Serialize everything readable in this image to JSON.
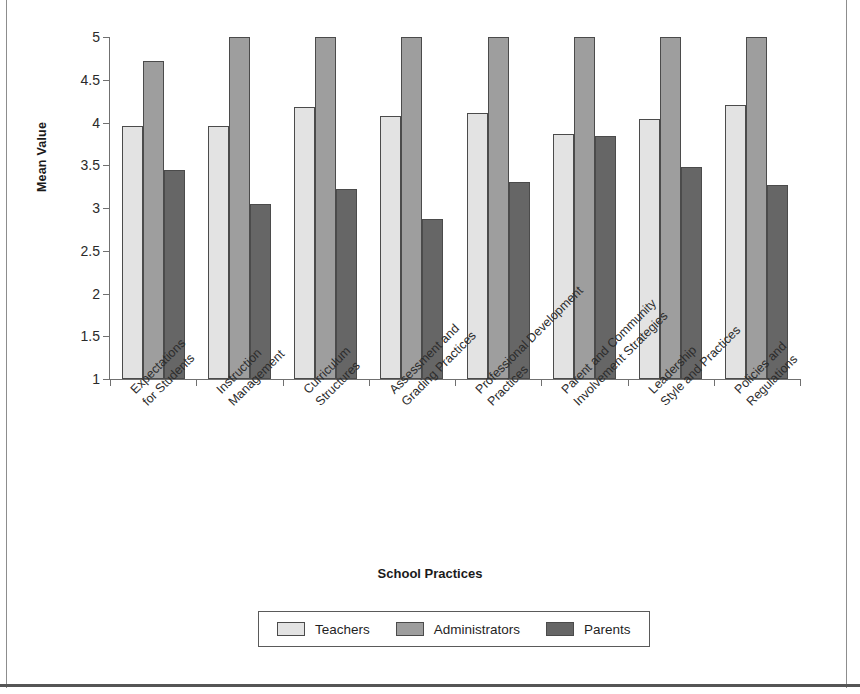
{
  "chart_data": {
    "type": "bar",
    "title": "",
    "xlabel": "School Practices",
    "ylabel": "Mean Value",
    "ylim": [
      1,
      5
    ],
    "yticks": [
      "1",
      "1.5",
      "2",
      "2.5",
      "3",
      "3.5",
      "4",
      "4.5",
      "5"
    ],
    "grid": false,
    "legend_position": "bottom",
    "categories": [
      "Expectations for Students",
      "Instruction Management",
      "Curriculum Structures",
      "Assessment and Grading Practices",
      "Professional Development Practices",
      "Parent and Community Involvement Strategies",
      "Leadership Style and Practices",
      "Policies and Regulations"
    ],
    "category_lines": [
      [
        "Expectations",
        "for Students"
      ],
      [
        "Instruction",
        "Management"
      ],
      [
        "Curriculum",
        "Structures"
      ],
      [
        "Assessment and",
        "Grading Practices"
      ],
      [
        "Professional Development",
        "Practices"
      ],
      [
        "Parent and Community",
        "Involvement Strategies"
      ],
      [
        "Leadership",
        "Style and Practices"
      ],
      [
        "Policies and",
        "Regulations"
      ]
    ],
    "series": [
      {
        "name": "Teachers",
        "color": "#e3e3e3",
        "values": [
          3.96,
          3.96,
          4.18,
          4.08,
          4.11,
          3.87,
          4.04,
          4.21
        ]
      },
      {
        "name": "Administrators",
        "color": "#9e9e9e",
        "values": [
          4.72,
          5.0,
          5.0,
          5.0,
          5.0,
          5.0,
          5.0,
          5.0
        ]
      },
      {
        "name": "Parents",
        "color": "#666666",
        "values": [
          3.44,
          3.05,
          3.22,
          2.87,
          3.31,
          3.84,
          3.48,
          3.27
        ]
      }
    ]
  },
  "legend": {
    "items": [
      {
        "label": "Teachers"
      },
      {
        "label": "Administrators"
      },
      {
        "label": "Parents"
      }
    ]
  },
  "axes": {
    "y_title": "Mean Value",
    "x_title": "School Practices"
  }
}
